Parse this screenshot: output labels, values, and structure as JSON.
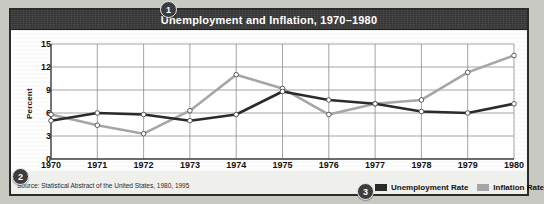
{
  "figure": {
    "title": "Unemployment and Inflation, 1970–1980",
    "source_note": "Source: Statistical Abstract of the United States, 1980, 1995",
    "callouts": {
      "one": "1",
      "two": "2",
      "three": "3"
    }
  },
  "legend": {
    "items": [
      {
        "label": "Unemployment Rate",
        "color": "#2b2b2b"
      },
      {
        "label": "Inflation Rate",
        "color": "#a6a6a6"
      }
    ]
  },
  "chart_data": {
    "type": "line",
    "title": "Unemployment and Inflation, 1970–1980",
    "xlabel": "",
    "ylabel": "Percent",
    "categories": [
      "1970",
      "1971",
      "1972",
      "1973",
      "1974",
      "1975",
      "1976",
      "1977",
      "1978",
      "1979",
      "1980"
    ],
    "x": [
      1970,
      1971,
      1972,
      1973,
      1974,
      1975,
      1976,
      1977,
      1978,
      1979,
      1980
    ],
    "ylim": [
      0,
      15
    ],
    "yticks": [
      0,
      3,
      6,
      9,
      12,
      15
    ],
    "grid": true,
    "legend_position": "bottom-right",
    "series": [
      {
        "name": "Unemployment Rate",
        "color": "#2b2b2b",
        "values": [
          5.0,
          6.0,
          5.8,
          5.0,
          5.8,
          8.8,
          7.7,
          7.2,
          6.2,
          6.0,
          7.2
        ]
      },
      {
        "name": "Inflation Rate",
        "color": "#a6a6a6",
        "values": [
          5.8,
          4.4,
          3.3,
          6.3,
          11.0,
          9.2,
          5.8,
          7.2,
          7.7,
          11.3,
          13.5
        ]
      }
    ]
  }
}
